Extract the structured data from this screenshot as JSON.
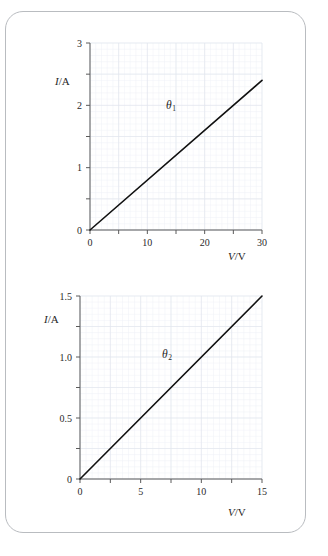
{
  "page": {
    "background_color": "#ffffff",
    "border_color": "#b9bcc0"
  },
  "style": {
    "grid_color": "#e2e7ee",
    "grid_minor_color": "#eef1f6",
    "axis_color": "#5a5a5a",
    "line_color": "#111111"
  },
  "chart_data": [
    {
      "type": "line",
      "id": "graph-theta-1",
      "title": "",
      "xlabel": "V/V",
      "ylabel": "I/A",
      "xlim": [
        0,
        30
      ],
      "ylim": [
        0,
        3
      ],
      "xticks": [
        0,
        5,
        10,
        15,
        20,
        25,
        30
      ],
      "xticklabels": [
        "0",
        "",
        "10",
        "",
        "20",
        "",
        "30"
      ],
      "yticks": [
        0,
        0.5,
        1,
        1.5,
        2,
        2.5,
        3
      ],
      "yticklabels": [
        "0",
        "",
        "1",
        "",
        "2",
        "",
        "3"
      ],
      "grid": true,
      "grid_step_x": 1,
      "grid_step_y": 0.1,
      "annotations": [
        {
          "text": "θ",
          "sub": "1",
          "x": 13.5,
          "y": 2.05
        }
      ],
      "series": [
        {
          "name": "theta-1",
          "x": [
            0,
            30
          ],
          "y": [
            0,
            2.4
          ],
          "slope": 0.08
        }
      ]
    },
    {
      "type": "line",
      "id": "graph-theta-2",
      "title": "",
      "xlabel": "V/V",
      "ylabel": "I/A",
      "xlim": [
        0,
        15
      ],
      "ylim": [
        0,
        1.5
      ],
      "xticks": [
        0,
        2.5,
        5,
        7.5,
        10,
        12.5,
        15
      ],
      "xticklabels": [
        "0",
        "",
        "5",
        "",
        "10",
        "",
        "15"
      ],
      "yticks": [
        0,
        0.25,
        0.5,
        0.75,
        1.0,
        1.25,
        1.5
      ],
      "yticklabels": [
        "0",
        "",
        "0.5",
        "",
        "1.0",
        "",
        "1.5"
      ],
      "grid": true,
      "grid_step_x": 0.5,
      "grid_step_y": 0.05,
      "annotations": [
        {
          "text": "θ",
          "sub": "2",
          "x": 6.6,
          "y": 1.05
        }
      ],
      "series": [
        {
          "name": "theta-2",
          "x": [
            0,
            15
          ],
          "y": [
            0,
            1.5
          ],
          "slope": 0.1
        }
      ]
    }
  ],
  "labels": {
    "chart1": {
      "y_axis": {
        "symbol": "I",
        "unit": "A",
        "full": "I/A"
      },
      "x_axis": {
        "symbol": "V",
        "unit": "V",
        "full": "V/V"
      },
      "theta": {
        "symbol": "θ",
        "sub": "1"
      }
    },
    "chart2": {
      "y_axis": {
        "symbol": "I",
        "unit": "A",
        "full": "I/A"
      },
      "x_axis": {
        "symbol": "V",
        "unit": "V",
        "full": "V/V"
      },
      "theta": {
        "symbol": "θ",
        "sub": "2"
      }
    }
  }
}
